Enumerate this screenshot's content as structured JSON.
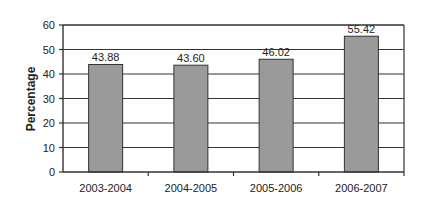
{
  "chart_data": {
    "type": "bar",
    "title": "",
    "xlabel": "",
    "ylabel": "Percentage",
    "categories": [
      "2003-2004",
      "2004-2005",
      "2005-2006",
      "2006-2007"
    ],
    "values": [
      43.88,
      43.6,
      46.02,
      55.42
    ],
    "data_labels": [
      "43.88",
      "43.60",
      "46.02",
      "55.42"
    ],
    "ylim": [
      0,
      60
    ],
    "yticks": [
      0,
      10,
      20,
      30,
      40,
      50,
      60
    ],
    "grid": true,
    "legend": null,
    "colors": {
      "bar": "#9a9a9a",
      "bar_edge": "#333333",
      "grid": "#333333",
      "axis": "#333333"
    }
  }
}
